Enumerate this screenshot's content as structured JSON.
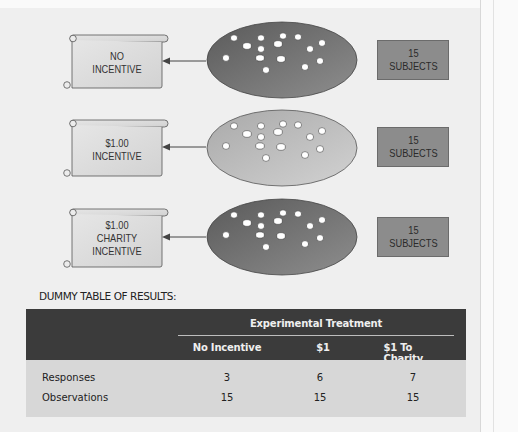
{
  "rows": [
    {
      "outcome": "NO\nINCENTIVE",
      "outcome_lines": [
        "NO",
        "INCENTIVE"
      ],
      "group_shade": "dark",
      "subjects": {
        "count": "15",
        "label": "SUBJECTS"
      }
    },
    {
      "outcome": "$1.00\nINCENTIVE",
      "outcome_lines": [
        "$1.00",
        "INCENTIVE"
      ],
      "group_shade": "light",
      "subjects": {
        "count": "15",
        "label": "SUBJECTS"
      }
    },
    {
      "outcome": "$1.00\nCHARITY\nINCENTIVE",
      "outcome_lines": [
        "$1.00",
        "CHARITY",
        "INCENTIVE"
      ],
      "group_shade": "dark",
      "subjects": {
        "count": "15",
        "label": "SUBJECTS"
      }
    }
  ],
  "colors": {
    "ellipse_dark": "#6e6e6e",
    "ellipse_light": "#bdbdbd",
    "subjects_box": "#8c8c8c",
    "table_header": "#3b3b3b",
    "table_body": "#d7d7d7",
    "page_bg": "#efefef"
  },
  "table": {
    "label": "DUMMY TABLE OF RESULTS:",
    "group_header": "Experimental Treatment",
    "columns": [
      "No Incentive",
      "$1",
      "$1 To Charity"
    ],
    "rows": [
      {
        "label": "Responses",
        "values": [
          "3",
          "6",
          "7"
        ]
      },
      {
        "label": "Observations",
        "values": [
          "15",
          "15",
          "15"
        ]
      }
    ]
  }
}
